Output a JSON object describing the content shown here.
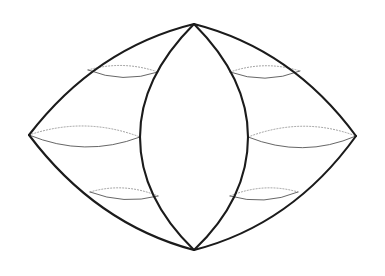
{
  "figure": {
    "type": "line-diagram",
    "background_color": "#ffffff",
    "stroke_color_outline": "#1b1b1b",
    "stroke_color_latitude_front": "#4a4a4a",
    "stroke_color_latitude_back": "#8d8d8d",
    "canvas": {
      "width": 385,
      "height": 276
    },
    "vertices": {
      "top_apex": {
        "x": 194,
        "y": 24
      },
      "bottom_apex": {
        "x": 194,
        "y": 250
      },
      "left_tip": {
        "x": 29,
        "y": 135
      },
      "right_tip": {
        "x": 356,
        "y": 136
      },
      "lens_left": {
        "x": 140,
        "y": 137
      },
      "lens_right": {
        "x": 248,
        "y": 137
      }
    },
    "outline_paths": [
      {
        "name": "outer-upper-left",
        "d": "M 194 24 Q 96 48 29 135"
      },
      {
        "name": "outer-lower-left",
        "d": "M 29 135 Q 96 224 194 250"
      },
      {
        "name": "outer-upper-right",
        "d": "M 194 24 Q 292 49 356 136"
      },
      {
        "name": "outer-lower-right",
        "d": "M 356 136 Q 292 225 194 250"
      }
    ],
    "meridian_paths": [
      {
        "name": "lens-left-meridian",
        "d": "M 194 24 C 156 62 140 101 140 137 C 140 176 158 215 194 250"
      },
      {
        "name": "lens-right-meridian",
        "d": "M 194 24 C 232 62 248 101 248 137 C 248 176 231 215 194 250"
      }
    ],
    "latitudes": [
      {
        "name": "left-upper-latitude",
        "side": "left",
        "band": "upper",
        "back_arc": "M 88 70 Q 123 60 158 72",
        "front_arc": "M 88 70 Q 123 84 158 72"
      },
      {
        "name": "left-middle-latitude",
        "side": "left",
        "band": "middle",
        "back_arc": "M 29 135 Q 85 116 140 137",
        "front_arc": "M 29 135 Q 85 158 140 137"
      },
      {
        "name": "left-lower-latitude",
        "side": "left",
        "band": "lower",
        "back_arc": "M 90 192 Q 124 182 158 196",
        "front_arc": "M 90 192 Q 124 205 158 196"
      },
      {
        "name": "right-upper-latitude",
        "side": "right",
        "band": "upper",
        "back_arc": "M 230 72 Q 265 60 300 71",
        "front_arc": "M 230 72 Q 265 85 300 71"
      },
      {
        "name": "right-middle-latitude",
        "side": "right",
        "band": "middle",
        "back_arc": "M 248 137 Q 303 116 356 136",
        "front_arc": "M 248 137 Q 303 159 356 136"
      },
      {
        "name": "right-lower-latitude",
        "side": "right",
        "band": "lower",
        "back_arc": "M 230 196 Q 264 182 298 192",
        "front_arc": "M 230 196 Q 264 206 298 192"
      }
    ]
  }
}
